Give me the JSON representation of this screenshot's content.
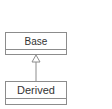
{
  "diagram": {
    "type": "uml-class",
    "classes": [
      {
        "name": "Base"
      },
      {
        "name": "Derived"
      }
    ],
    "relations": [
      {
        "from": "Derived",
        "to": "Base",
        "kind": "generalization"
      }
    ]
  },
  "colors": {
    "line": "#8c8c8c",
    "text": "#333333",
    "background": "#ffffff"
  }
}
